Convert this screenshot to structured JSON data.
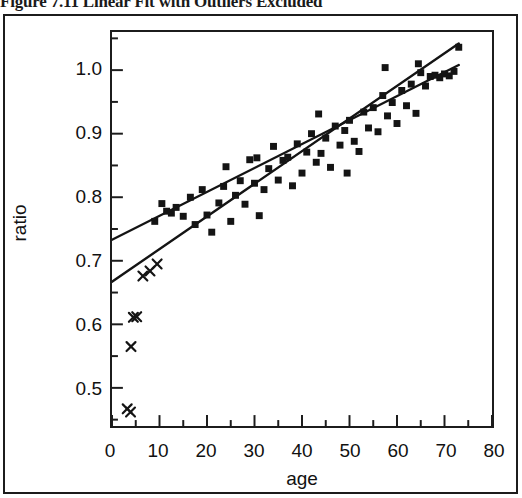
{
  "figure": {
    "caption_number": "Figure 7.11",
    "caption_text": "Figure 7.11  Linear Fit with Outliers Excluded"
  },
  "chart_data": {
    "type": "scatter",
    "title": "Figure 7.11  Linear Fit with Outliers Excluded",
    "xlabel": "age",
    "ylabel": "ratio",
    "xlim": [
      0,
      80
    ],
    "ylim": [
      0.44,
      1.06
    ],
    "grid": false,
    "legend": null,
    "x_ticks": [
      0,
      10,
      20,
      30,
      40,
      50,
      60,
      70,
      80
    ],
    "x_tick_labels": [
      "0",
      "10",
      "20",
      "30",
      "40",
      "50",
      "60",
      "70",
      "80"
    ],
    "x_minor_ticks": [
      5,
      15,
      25,
      35,
      45,
      55,
      65,
      75
    ],
    "y_ticks": [
      0.5,
      0.6,
      0.7,
      0.8,
      0.9,
      1.0
    ],
    "y_tick_labels": [
      "0.5",
      "0.6",
      "0.7",
      "0.8",
      "0.9",
      "1.0"
    ],
    "y_minor_ticks": [
      0.45,
      0.55,
      0.65,
      0.75,
      0.85,
      0.95,
      1.05
    ],
    "series": [
      {
        "name": "included-data",
        "marker": "square",
        "marker_size": 7,
        "color": "#141414",
        "points": [
          [
            9.0,
            0.762
          ],
          [
            10.5,
            0.79
          ],
          [
            11.5,
            0.778
          ],
          [
            12.5,
            0.775
          ],
          [
            13.5,
            0.784
          ],
          [
            15.0,
            0.77
          ],
          [
            16.5,
            0.8
          ],
          [
            17.5,
            0.757
          ],
          [
            19.0,
            0.812
          ],
          [
            20.0,
            0.772
          ],
          [
            21.0,
            0.745
          ],
          [
            22.5,
            0.791
          ],
          [
            23.5,
            0.817
          ],
          [
            25.0,
            0.762
          ],
          [
            26.0,
            0.803
          ],
          [
            27.0,
            0.826
          ],
          [
            28.0,
            0.789
          ],
          [
            29.0,
            0.859
          ],
          [
            30.0,
            0.822
          ],
          [
            31.0,
            0.771
          ],
          [
            32.0,
            0.812
          ],
          [
            33.0,
            0.845
          ],
          [
            34.0,
            0.88
          ],
          [
            35.0,
            0.827
          ],
          [
            36.0,
            0.858
          ],
          [
            37.0,
            0.863
          ],
          [
            38.0,
            0.818
          ],
          [
            39.0,
            0.884
          ],
          [
            40.0,
            0.838
          ],
          [
            41.0,
            0.871
          ],
          [
            42.0,
            0.9
          ],
          [
            43.0,
            0.855
          ],
          [
            44.0,
            0.869
          ],
          [
            45.0,
            0.893
          ],
          [
            46.0,
            0.847
          ],
          [
            47.0,
            0.912
          ],
          [
            48.0,
            0.882
          ],
          [
            49.0,
            0.905
          ],
          [
            50.0,
            0.921
          ],
          [
            51.0,
            0.888
          ],
          [
            52.0,
            0.872
          ],
          [
            53.0,
            0.934
          ],
          [
            54.0,
            0.909
          ],
          [
            55.0,
            0.941
          ],
          [
            56.0,
            0.903
          ],
          [
            57.0,
            0.96
          ],
          [
            58.0,
            0.928
          ],
          [
            59.0,
            0.949
          ],
          [
            60.0,
            0.916
          ],
          [
            61.0,
            0.968
          ],
          [
            62.0,
            0.944
          ],
          [
            63.0,
            0.978
          ],
          [
            64.0,
            0.932
          ],
          [
            65.0,
            0.996
          ],
          [
            66.0,
            0.975
          ],
          [
            67.0,
            0.99
          ],
          [
            68.0,
            0.992
          ],
          [
            69.0,
            0.988
          ],
          [
            70.0,
            0.994
          ],
          [
            71.0,
            0.991
          ],
          [
            72.0,
            0.998
          ],
          [
            73.0,
            1.036
          ],
          [
            64.5,
            1.01
          ],
          [
            57.5,
            1.004
          ],
          [
            30.5,
            0.862
          ],
          [
            24.0,
            0.848
          ],
          [
            43.5,
            0.931
          ],
          [
            49.5,
            0.838
          ]
        ]
      },
      {
        "name": "excluded-outliers",
        "marker": "x",
        "marker_size": 9,
        "color": "#141414",
        "points": [
          [
            6.5,
            0.676
          ],
          [
            8.0,
            0.684
          ],
          [
            9.5,
            0.695
          ],
          [
            4.5,
            0.611
          ],
          [
            5.2,
            0.612
          ],
          [
            4.0,
            0.565
          ],
          [
            3.2,
            0.467
          ],
          [
            3.9,
            0.462
          ]
        ]
      }
    ],
    "fit_lines": [
      {
        "name": "fit-all-data",
        "label": "Linear fit including outliers",
        "x": [
          0,
          73
        ],
        "y": [
          0.733,
          1.008
        ],
        "color": "#141414",
        "width": 2.4
      },
      {
        "name": "fit-outliers-excluded",
        "label": "Linear fit with outliers excluded",
        "x": [
          0,
          73
        ],
        "y": [
          0.667,
          1.042
        ],
        "color": "#141414",
        "width": 2.4
      }
    ]
  }
}
